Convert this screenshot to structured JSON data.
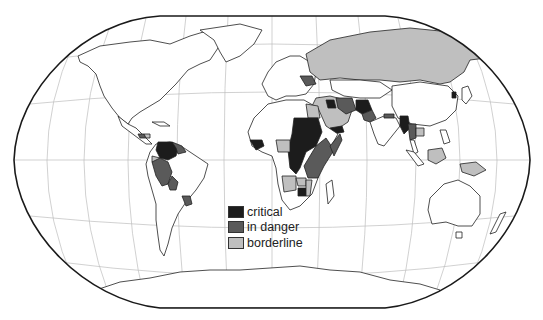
{
  "map": {
    "projection": "Winkel-tripel style world map",
    "colors": {
      "critical": "#1c1c1c",
      "in_danger": "#5a5a5a",
      "borderline": "#bfbfbf",
      "unaffected": "#ffffff",
      "outline": "#222222",
      "graticule": "#b8b8b8"
    },
    "regions": {
      "critical": [
        "Colombia",
        "Sudan",
        "Chad",
        "Central African Republic",
        "DR Congo",
        "Zimbabwe",
        "Afghanistan",
        "Iraq",
        "Sierra Leone / Liberia",
        "Yemen",
        "Myanmar"
      ],
      "in_danger": [
        "Venezuela",
        "Peru",
        "Bolivia",
        "Paraguay",
        "Guatemala",
        "Ethiopia",
        "Kenya",
        "Tanzania",
        "Ukraine",
        "Pakistan",
        "Iran",
        "Somalia",
        "Thailand",
        "Nepal"
      ],
      "borderline": [
        "Russia",
        "Kazakhstan",
        "Saudi Arabia",
        "Egypt",
        "Nigeria",
        "Angola",
        "Ecuador",
        "Honduras",
        "Indonesia (Borneo)",
        "Papua New Guinea",
        "Cambodia",
        "Mozambique",
        "Zambia"
      ]
    }
  },
  "legend": {
    "items": [
      {
        "key": "critical",
        "label": "critical",
        "color": "#1c1c1c"
      },
      {
        "key": "in_danger",
        "label": "in danger",
        "color": "#5a5a5a"
      },
      {
        "key": "borderline",
        "label": "borderline",
        "color": "#bfbfbf"
      }
    ]
  }
}
